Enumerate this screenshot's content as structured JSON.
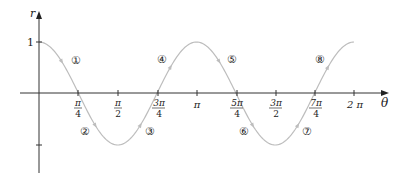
{
  "chart_data": {
    "type": "line",
    "title": "",
    "function": "r = cos(2θ)",
    "xlabel": "θ",
    "ylabel": "r",
    "xlim": [
      0,
      6.2832
    ],
    "ylim": [
      -1,
      1
    ],
    "grid": false,
    "legend": "none",
    "x_ticks": [
      {
        "value": 0.7854,
        "num": "π",
        "den": "4"
      },
      {
        "value": 1.5708,
        "num": "π",
        "den": "2"
      },
      {
        "value": 2.3562,
        "num": "3π",
        "den": "4"
      },
      {
        "value": 3.1416,
        "label": "π"
      },
      {
        "value": 3.927,
        "num": "5π",
        "den": "4"
      },
      {
        "value": 4.7124,
        "num": "3π",
        "den": "2"
      },
      {
        "value": 5.4978,
        "num": "7π",
        "den": "4"
      },
      {
        "value": 6.2832,
        "label": "2 π"
      }
    ],
    "y_ticks": [
      {
        "value": 1,
        "label": "1"
      },
      {
        "value": -1,
        "label": ""
      }
    ],
    "series": [
      {
        "name": "cos(2θ)",
        "color": "#b8b8b8",
        "x": [
          0,
          0.3927,
          0.7854,
          1.1781,
          1.5708,
          1.9635,
          2.3562,
          2.7489,
          3.1416,
          3.5343,
          3.927,
          4.3197,
          4.7124,
          5.1051,
          5.4978,
          5.8905,
          6.2832
        ],
        "values": [
          1,
          0.707,
          0,
          -0.707,
          -1,
          -0.707,
          0,
          0.707,
          1,
          0.707,
          0,
          -0.707,
          -1,
          -0.707,
          0,
          0.707,
          1
        ]
      }
    ],
    "annotations": [
      {
        "text": "①",
        "theta": 0.75,
        "r": 0.45
      },
      {
        "text": "②",
        "theta": 0.92,
        "r": -0.72
      },
      {
        "text": "③",
        "theta": 2.23,
        "r": -0.72
      },
      {
        "text": "④",
        "theta": 2.49,
        "r": 0.46
      },
      {
        "text": "⑤",
        "theta": 3.92,
        "r": 0.46
      },
      {
        "text": "⑥",
        "theta": 4.22,
        "r": -0.72
      },
      {
        "text": "⑦",
        "theta": 5.5,
        "r": -0.72
      },
      {
        "text": "⑧",
        "theta": 5.77,
        "r": 0.46
      }
    ]
  },
  "labels": {
    "r_axis": "r",
    "theta_axis": "θ",
    "y_one": "1",
    "tick_pi_over_4_num": "π",
    "tick_pi_over_4_den": "4",
    "tick_pi_over_2_num": "π",
    "tick_pi_over_2_den": "2",
    "tick_3pi_over_4_num": "3π",
    "tick_3pi_over_4_den": "4",
    "tick_pi": "π",
    "tick_5pi_over_4_num": "5π",
    "tick_5pi_over_4_den": "4",
    "tick_3pi_over_2_num": "3π",
    "tick_3pi_over_2_den": "2",
    "tick_7pi_over_4_num": "7π",
    "tick_7pi_over_4_den": "4",
    "tick_2pi": "2 π",
    "seg1": "①",
    "seg2": "②",
    "seg3": "③",
    "seg4": "④",
    "seg5": "⑤",
    "seg6": "⑥",
    "seg7": "⑦",
    "seg8": "⑧"
  }
}
